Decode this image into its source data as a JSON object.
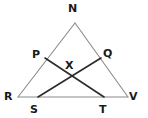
{
  "figure": {
    "type": "geometry-diagram",
    "background_color": "#ffffff",
    "outline_color": "#8a8a8a",
    "cevian_color": "#2b2b2b",
    "label_color": "#1a1a1a",
    "points": [
      {
        "id": "N",
        "label": "N",
        "x": 75,
        "y": 23,
        "label_x": 68,
        "label_y": 3
      },
      {
        "id": "P",
        "label": "P",
        "x": 45,
        "y": 58,
        "label_x": 32,
        "label_y": 49
      },
      {
        "id": "Q",
        "label": "Q",
        "x": 101,
        "y": 58,
        "label_x": 103,
        "label_y": 48
      },
      {
        "id": "X",
        "label": "X",
        "x": 71,
        "y": 75,
        "label_x": 65,
        "label_y": 60
      },
      {
        "id": "R",
        "label": "R",
        "x": 18,
        "y": 97,
        "label_x": 4,
        "label_y": 91
      },
      {
        "id": "S",
        "label": "S",
        "x": 38,
        "y": 97,
        "label_x": 30,
        "label_y": 104
      },
      {
        "id": "T",
        "label": "T",
        "x": 104,
        "y": 97,
        "label_x": 99,
        "label_y": 104
      },
      {
        "id": "V",
        "label": "V",
        "x": 128,
        "y": 97,
        "label_x": 129,
        "label_y": 91
      }
    ],
    "segments": [
      {
        "id": "NR",
        "from": "N",
        "to": "R",
        "style": "light"
      },
      {
        "id": "NV",
        "from": "N",
        "to": "V",
        "style": "light"
      },
      {
        "id": "RV",
        "from": "R",
        "to": "V",
        "style": "light"
      },
      {
        "id": "PT",
        "from": "P",
        "to": "T",
        "style": "dark"
      },
      {
        "id": "QS",
        "from": "Q",
        "to": "S",
        "style": "dark"
      }
    ]
  }
}
